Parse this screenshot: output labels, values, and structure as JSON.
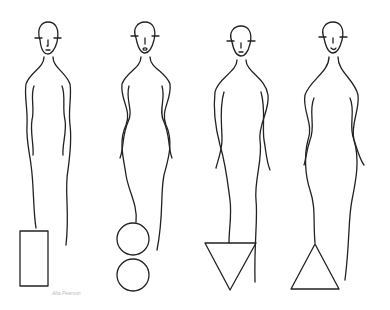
{
  "illustration": {
    "subject": "Four female body-shape line drawings",
    "figures": [
      {
        "id": "rectangle",
        "shape_label": "rectangle",
        "symbol": "rectangle"
      },
      {
        "id": "hourglass",
        "shape_label": "hourglass",
        "symbol": "two-circles"
      },
      {
        "id": "inverted-triangle",
        "shape_label": "inverted triangle",
        "symbol": "inverted-triangle"
      },
      {
        "id": "triangle",
        "shape_label": "triangle",
        "symbol": "triangle"
      }
    ],
    "signature": "Alta Pearson"
  },
  "colors": {
    "line": "#222222",
    "background": "#ffffff"
  }
}
